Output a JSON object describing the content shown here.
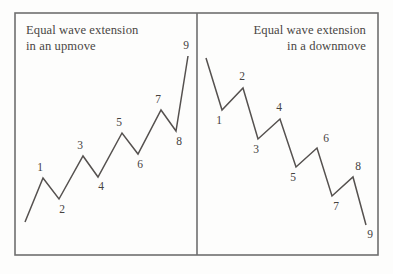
{
  "figure": {
    "background_color": "#fdfdfc",
    "line_color": "#55514f",
    "frame_color": "#6f6f6f",
    "frame": {
      "x": 15,
      "y": 13,
      "width": 363,
      "height": 242
    },
    "divider": {
      "x": 197,
      "y1": 13,
      "y2": 255
    }
  },
  "panels": [
    {
      "id": "upmove",
      "title_line1": "Equal wave extension",
      "title_line2": "in an upmove",
      "title_align": "left",
      "title_x": 26,
      "title_y1": 34,
      "title_y2": 50,
      "wave": {
        "type": "zigzag-up",
        "points": [
          [
            25,
            222
          ],
          [
            43,
            178
          ],
          [
            59,
            199
          ],
          [
            83,
            156
          ],
          [
            98,
            177
          ],
          [
            122,
            133
          ],
          [
            138,
            154
          ],
          [
            161,
            110
          ],
          [
            176,
            131
          ],
          [
            188,
            56
          ]
        ]
      },
      "labels": [
        {
          "text": "1",
          "x": 40,
          "y": 171
        },
        {
          "text": "2",
          "x": 62,
          "y": 213
        },
        {
          "text": "3",
          "x": 80,
          "y": 149
        },
        {
          "text": "4",
          "x": 101,
          "y": 190
        },
        {
          "text": "5",
          "x": 119,
          "y": 126
        },
        {
          "text": "6",
          "x": 140,
          "y": 168
        },
        {
          "text": "7",
          "x": 158,
          "y": 103
        },
        {
          "text": "8",
          "x": 179,
          "y": 145
        },
        {
          "text": "9",
          "x": 186,
          "y": 49
        }
      ]
    },
    {
      "id": "downmove",
      "title_line1": "Equal wave extension",
      "title_line2": "in a downmove",
      "title_align": "right",
      "title_x": 366,
      "title_y1": 34,
      "title_y2": 50,
      "wave": {
        "type": "zigzag-down",
        "points": [
          [
            206,
            58
          ],
          [
            222,
            110
          ],
          [
            243,
            88
          ],
          [
            258,
            139
          ],
          [
            280,
            119
          ],
          [
            296,
            167
          ],
          [
            317,
            148
          ],
          [
            332,
            196
          ],
          [
            353,
            177
          ],
          [
            366,
            225
          ]
        ]
      },
      "labels": [
        {
          "text": "1",
          "x": 219,
          "y": 124
        },
        {
          "text": "2",
          "x": 242,
          "y": 80
        },
        {
          "text": "3",
          "x": 256,
          "y": 153
        },
        {
          "text": "4",
          "x": 279,
          "y": 111
        },
        {
          "text": "5",
          "x": 293,
          "y": 181
        },
        {
          "text": "6",
          "x": 326,
          "y": 142
        },
        {
          "text": "7",
          "x": 336,
          "y": 210
        },
        {
          "text": "8",
          "x": 358,
          "y": 170
        },
        {
          "text": "9",
          "x": 370,
          "y": 238
        }
      ]
    }
  ]
}
